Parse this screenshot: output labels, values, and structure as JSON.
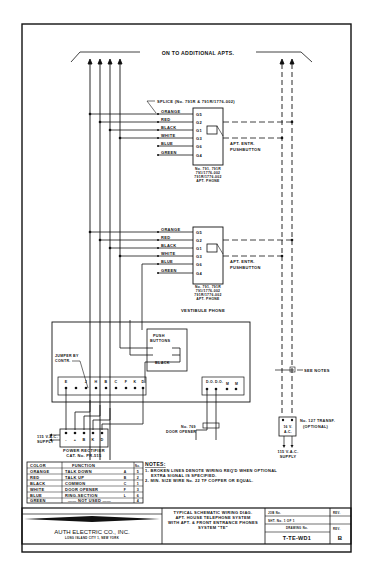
{
  "diagram": {
    "top_label": "ON TO ADDITIONAL APTS.",
    "splice_label": "SPLICE (No. 791R & 791R/1776-002)",
    "apt_phones": [
      {
        "wires": [
          "ORANGE",
          "RED",
          "BLACK",
          "WHITE",
          "BLUE",
          "GREEN"
        ],
        "terminals": [
          "G5",
          "G2",
          "G1",
          "G3",
          "G6",
          "G4"
        ],
        "model_lines": [
          "No. 791, 791R",
          "791/1776-002",
          "791R/1776-002",
          "APT. PHONE"
        ],
        "pushbutton_label_1": "APT. ENTR.",
        "pushbutton_label_2": "PUSHBUTTON"
      },
      {
        "wires": [
          "ORANGE",
          "RED",
          "BLACK",
          "WHITE",
          "BLUE",
          "GREEN"
        ],
        "terminals": [
          "G5",
          "G2",
          "G1",
          "G3",
          "G6",
          "G4"
        ],
        "model_lines": [
          "No. 791, 791R",
          "791/1776-002",
          "791R/1776-002",
          "APT. PHONE"
        ],
        "pushbutton_label_1": "APT. ENTR.",
        "pushbutton_label_2": "PUSHBUTTON"
      }
    ],
    "vestibule_label": "VESTIBULE PHONE",
    "push_buttons_label_1": "PUSH",
    "push_buttons_label_2": "BUTTONS",
    "black_label": "BLACK",
    "jumper_label_1": "JUMPER BY",
    "jumper_label_2": "CONTR.",
    "vestibule_terminals": [
      "E",
      "",
      "J",
      "H",
      "B",
      "C",
      "F",
      "K",
      "D"
    ],
    "door_terminals": [
      "D.O.",
      "D.O.",
      "M",
      "M"
    ],
    "see_notes": "SEE NOTES",
    "transformer_label_1": "No. 127 TRANSF.",
    "transformer_label_2": "(OPTIONAL)",
    "transformer_inner_1": "16 V.",
    "transformer_inner_2": "A.C.",
    "supply_right_1": "115 V.A.C.",
    "supply_right_2": "SUPPLY",
    "door_opener_1": "No. 769",
    "door_opener_2": "DOOR OPENER",
    "supply_left_1": "115 V.A.C.",
    "supply_left_2": "SUPPLY",
    "rectifier_terminals": [
      "-",
      "+",
      "B",
      "K",
      "D"
    ],
    "rectifier_label_1": "POWER RECTIFIER",
    "rectifier_label_2": "CAT. No. PR-515"
  },
  "color_table": {
    "headers": [
      "COLOR",
      "FUNCTION",
      "No."
    ],
    "rows": [
      {
        "color": "ORANGE",
        "function": "TALK DOWN",
        "code": "A",
        "no": "5"
      },
      {
        "color": "RED",
        "function": "TALK UP",
        "code": "B",
        "no": "2"
      },
      {
        "color": "BLACK",
        "function": "COMMON",
        "code": "C",
        "no": "1"
      },
      {
        "color": "WHITE",
        "function": "DOOR OPENER",
        "code": "F",
        "no": "3"
      },
      {
        "color": "BLUE",
        "function": "RING-SECTION",
        "code": "L",
        "no": "6"
      },
      {
        "color": "GREEN",
        "function": "—— NOT USED ——",
        "code": "",
        "no": "4"
      }
    ]
  },
  "notes": {
    "title": "NOTES:",
    "lines": [
      "1- BROKEN LINES DENOTE WIRING REQ'D WHEN OPTIONAL",
      "EXTRA SIGNAL IS SPECIFIED.",
      "2- MIN. SIZE WIRE No. 22 TF COPPER OR EQUAL."
    ]
  },
  "title_block": {
    "company": "AUTH ELECTRIC CO., INC.",
    "address": "LONG ISLAND CITY 1, NEW YORK",
    "description_lines": [
      "TYPICAL SCHEMATIC WIRING DIAG.",
      "APT. HOUSE TELEPHONE SYSTEM",
      "WITH APT. & FRONT ENTRANCE PHONES",
      "SYSTEM \"TE\""
    ],
    "job_no_label": "JOB No.",
    "sheet_label": "SHT. No. 1 OF 1",
    "drawing_no_label": "DRAWING No.",
    "drawing_no": "T-TE-WD1",
    "rev_label": "REV.",
    "rev_label_2": "REV.",
    "rev_value": "B"
  }
}
